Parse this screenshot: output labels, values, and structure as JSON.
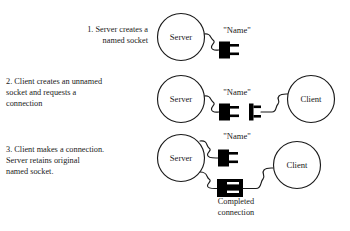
{
  "diagram": {
    "title_present": false,
    "background_color": "#ffffff",
    "stroke_color": "#1a1a1a",
    "fill_color": "#000000",
    "steps": [
      {
        "number": "1.",
        "caption": "1. Server creates a\nnamed socket",
        "server_label": "Server",
        "name_label": "\"Name\"",
        "client_label": null
      },
      {
        "number": "2.",
        "caption": "2. Client creates an unnamed\n    socket and requests a\n    connection",
        "server_label": "Server",
        "name_label": "\"Name\"",
        "client_label": "Client"
      },
      {
        "number": "3.",
        "caption": "3. Client makes a connection.\n    Server retains original\n    named socket.",
        "server_label": "Server",
        "name_label": "\"Name\"",
        "client_label": "Client"
      }
    ],
    "footer": {
      "completed_connection": "Completed\nconnection"
    },
    "icons": {
      "server_node": "server-circle-icon",
      "client_node": "client-circle-icon",
      "named_socket": "socket-plug-icon",
      "unnamed_socket": "client-plug-icon",
      "joined_connection": "mated-connector-icon",
      "cable": "wavy-cable-icon"
    }
  }
}
